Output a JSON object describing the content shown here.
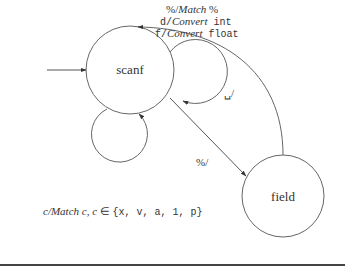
{
  "diagram": {
    "type": "state-machine",
    "states": [
      {
        "id": "scanf",
        "label": "scanf",
        "initial": true
      },
      {
        "id": "field",
        "label": "field",
        "initial": false
      }
    ],
    "transitions": [
      {
        "from": "scanf",
        "to": "scanf",
        "kind": "self-loop-top",
        "label": "␣/"
      },
      {
        "from": "scanf",
        "to": "scanf",
        "kind": "self-loop-bottom",
        "label_prefix": "c/",
        "label_action": "Match c, c",
        "label_in": " ∈ ",
        "label_set": "{x, v, a, 1, p}"
      },
      {
        "from": "scanf",
        "to": "field",
        "label": "%/"
      },
      {
        "from": "field",
        "to": "scanf",
        "labels": [
          {
            "input": "%/",
            "action": "Match",
            "arg": " %"
          },
          {
            "input": "d/",
            "action": "Convert",
            "arg": " int"
          },
          {
            "input": "f/",
            "action": "Convert",
            "arg": " float"
          }
        ]
      }
    ],
    "stroke_color": "#555555"
  }
}
